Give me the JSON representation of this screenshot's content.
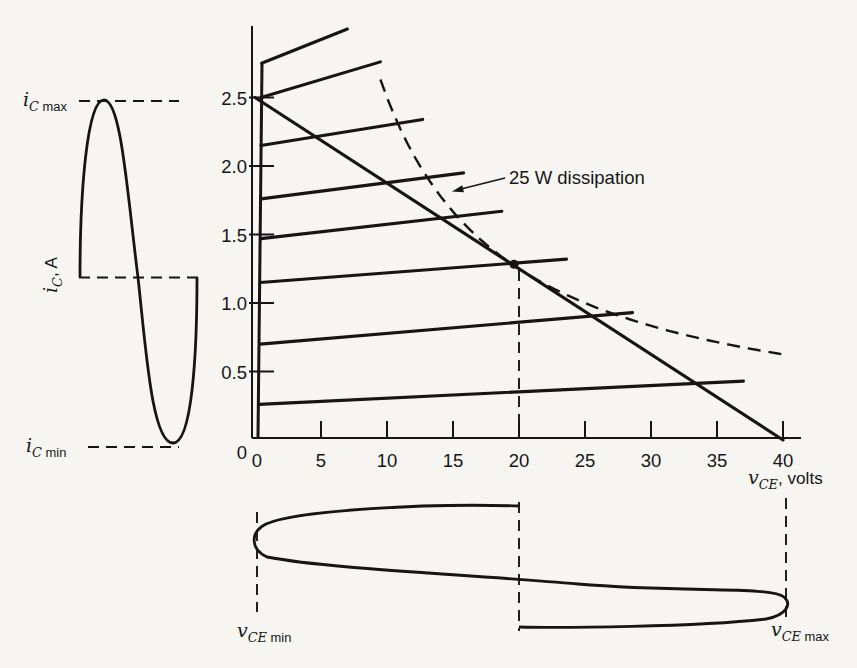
{
  "page": {
    "background": "#f6f5f1",
    "ink": "#151515"
  },
  "chart_data": {
    "type": "line",
    "x_axis": {
      "label": {
        "variable": "v",
        "subscript": "CE",
        "suffix": ", volts",
        "suffix_small": false
      },
      "tick_labels": [
        "0",
        "5",
        "10",
        "15",
        "20",
        "25",
        "30",
        "35",
        "40"
      ],
      "tick_values": [
        0,
        5,
        10,
        15,
        20,
        25,
        30,
        35,
        40
      ],
      "range": [
        0,
        41.5
      ],
      "units": "volts"
    },
    "y_axis": {
      "label": {
        "variable": "i",
        "subscript": "C",
        "suffix": ", A",
        "suffix_small": false
      },
      "tick_labels": [
        "0",
        "0.5",
        "1.0",
        "1.5",
        "2.0",
        "2.5"
      ],
      "tick_values": [
        0,
        0.5,
        1.0,
        1.5,
        2.0,
        2.5
      ],
      "range": [
        0,
        3.05
      ],
      "units": "A"
    },
    "load_line": {
      "from": {
        "v": 0,
        "i": 2.5
      },
      "to": {
        "v": 40,
        "i": 0
      }
    },
    "q_point": {
      "v": 20,
      "i": 1.3
    },
    "dissipation_hyperbola": {
      "power_watts": 25,
      "label": "25 W dissipation",
      "v_start": 9.5,
      "v_end": 40,
      "style": "dashed"
    },
    "characteristic_curves": [
      {
        "knee": {
          "v": 0.5,
          "i": 2.75
        },
        "end": {
          "v": 7.0,
          "i": 3.0
        }
      },
      {
        "knee": {
          "v": 0.45,
          "i": 2.5
        },
        "end": {
          "v": 9.5,
          "i": 2.76
        }
      },
      {
        "knee": {
          "v": 0.45,
          "i": 2.15
        },
        "end": {
          "v": 12.7,
          "i": 2.34
        }
      },
      {
        "knee": {
          "v": 0.45,
          "i": 1.76
        },
        "end": {
          "v": 15.8,
          "i": 1.95
        }
      },
      {
        "knee": {
          "v": 0.45,
          "i": 1.47
        },
        "end": {
          "v": 18.7,
          "i": 1.67
        }
      },
      {
        "knee": {
          "v": 0.4,
          "i": 1.15
        },
        "end": {
          "v": 23.6,
          "i": 1.32
        }
      },
      {
        "knee": {
          "v": 0.4,
          "i": 0.7
        },
        "end": {
          "v": 28.6,
          "i": 0.93
        }
      },
      {
        "knee": {
          "v": 0.3,
          "i": 0.26
        },
        "end": {
          "v": 37.0,
          "i": 0.43
        }
      }
    ],
    "waveforms": {
      "collector_current": {
        "shape": "sine, one full period, time axis horizontal, swings between iC max and iC min about the Q-point current",
        "max_label": {
          "variable": "i",
          "subscript": "C",
          "suffix": "max",
          "suffix_small": true
        },
        "min_label": {
          "variable": "i",
          "subscript": "C",
          "suffix": "min",
          "suffix_small": true
        }
      },
      "collector_voltage": {
        "shape": "sine, one full period, time axis vertical, swings between vCE min and vCE max about the Q-point voltage",
        "min_label": {
          "variable": "v",
          "subscript": "CE",
          "suffix": "min",
          "suffix_small": true
        },
        "max_label": {
          "variable": "v",
          "subscript": "CE",
          "suffix": "max",
          "suffix_small": true
        }
      }
    }
  }
}
